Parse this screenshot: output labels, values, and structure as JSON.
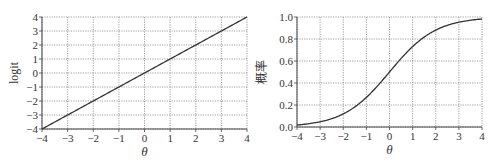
{
  "chart_data": [
    {
      "type": "line",
      "title": "",
      "xlabel": "θ",
      "ylabel": "logit",
      "xlim": [
        -4,
        4
      ],
      "ylim": [
        -4,
        4
      ],
      "xticks": [
        "−4",
        "−3",
        "−2",
        "−1",
        "0",
        "1",
        "2",
        "3",
        "4"
      ],
      "yticks": [
        "−4",
        "−3",
        "−2",
        "−1",
        "0",
        "1",
        "2",
        "3",
        "4"
      ],
      "grid": true,
      "series": [
        {
          "name": "logit",
          "x": [
            -4,
            -3,
            -2,
            -1,
            0,
            1,
            2,
            3,
            4
          ],
          "values": [
            -4,
            -3,
            -2,
            -1,
            0,
            1,
            2,
            3,
            4
          ]
        }
      ]
    },
    {
      "type": "line",
      "title": "",
      "xlabel": "θ",
      "ylabel": "概率",
      "xlim": [
        -4,
        4
      ],
      "ylim": [
        0.0,
        1.0
      ],
      "xticks": [
        "−4",
        "−3",
        "−2",
        "−1",
        "0",
        "1",
        "2",
        "3",
        "4"
      ],
      "yticks": [
        "0.0",
        "0.2",
        "0.4",
        "0.6",
        "0.8",
        "1.0"
      ],
      "grid": true,
      "series": [
        {
          "name": "probability",
          "x": [
            -4,
            -3,
            -2,
            -1,
            0,
            1,
            2,
            3,
            4
          ],
          "values": [
            0.018,
            0.047,
            0.119,
            0.269,
            0.5,
            0.731,
            0.881,
            0.953,
            0.982
          ]
        }
      ]
    }
  ]
}
